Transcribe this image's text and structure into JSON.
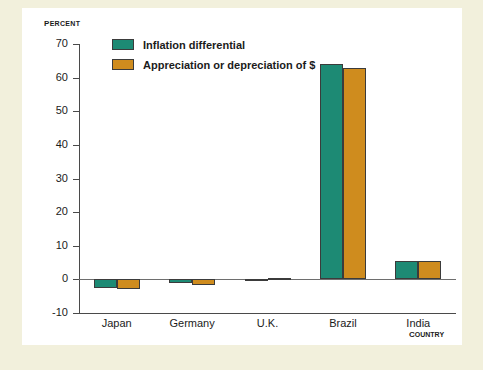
{
  "chart_data": {
    "type": "bar",
    "title": "",
    "subtitle": "",
    "xlabel": "Country",
    "ylabel": "Percent",
    "categories": [
      "Japan",
      "Germany",
      "U.K.",
      "Brazil",
      "India"
    ],
    "series": [
      {
        "name": "Inflation differential",
        "color": "#1d8a74",
        "values": [
          -2.5,
          -1.2,
          0.2,
          64,
          5.5
        ]
      },
      {
        "name": "Appreciation or depreciation of $",
        "color": "#cf8c1e",
        "values": [
          -3.0,
          -1.6,
          0.3,
          63,
          5.5
        ]
      }
    ],
    "ylim": [
      -10,
      70
    ],
    "yticks": [
      70,
      60,
      50,
      40,
      30,
      20,
      10,
      0,
      -10
    ],
    "ytick_labels": [
      "70",
      "60",
      "50",
      "40",
      "30",
      "20",
      "10",
      "0",
      "-10"
    ],
    "grid": false,
    "legend_position": "top-left",
    "zero_line": true
  },
  "figure": {
    "background_color": "#f2f0dc",
    "panel_color": "#ffffff",
    "axis_color": "#4a4a4a"
  }
}
